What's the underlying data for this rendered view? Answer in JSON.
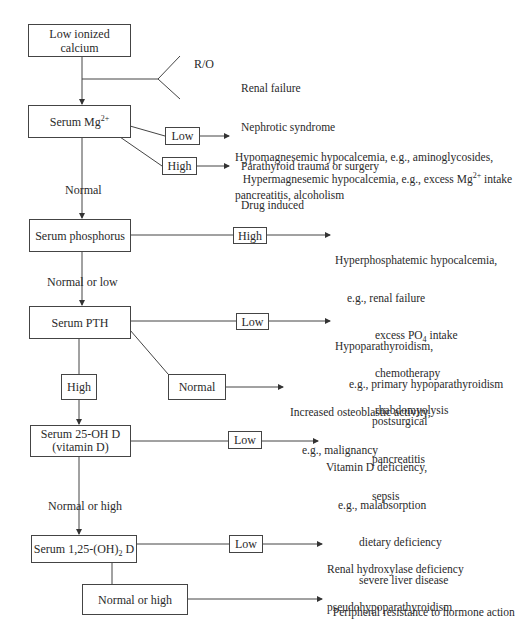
{
  "diagram": {
    "type": "flowchart",
    "start": {
      "label_line1": "Low ionized",
      "label_line2": "calcium"
    },
    "rule_out": {
      "label": "R/O",
      "items": [
        "Renal failure",
        "Nephrotic syndrome",
        "Parathyroid trauma or surgery",
        "Drug induced"
      ]
    },
    "mg": {
      "label": "Serum Mg",
      "label_sup": "2+",
      "low": {
        "label": "Low",
        "outcome_line1": "Hypomagnesemic hypocalcemia, e.g., aminoglycosides,",
        "outcome_line2": "pancreatitis, alcoholism"
      },
      "high": {
        "label": "High",
        "outcome": "Hypermagnesemic hypocalcemia, e.g., excess Mg",
        "outcome_sup": "2+",
        "outcome_tail": " intake"
      },
      "normal_label": "Normal"
    },
    "phosphorus": {
      "label": "Serum phosphorus",
      "high": {
        "label": "High",
        "outcome_line1": "Hyperphosphatemic hypocalcemia,",
        "outcome_line2": "e.g., renal failure",
        "outcome_line3a": "excess PO",
        "outcome_line3_sub": "4",
        "outcome_line3b": " intake",
        "outcome_line4": "chemotherapy",
        "outcome_line5": "rhabdomyolysis"
      },
      "normal_low_label": "Normal or low"
    },
    "pth": {
      "label": "Serum PTH",
      "low": {
        "label": "Low",
        "outcome_line1": "Hypoparathyroidism,",
        "outcome_line2": "e.g., primary hypoparathyroidism",
        "outcome_line3": "postsurgical",
        "outcome_line4": "pancreatitis",
        "outcome_line5": "sepsis"
      },
      "normal": {
        "label": "Normal",
        "outcome_line1": "Increased osteoblastic activity,",
        "outcome_line2": "e.g., malignancy"
      },
      "high_label": "High"
    },
    "vitd25": {
      "label_line1": "Serum 25-OH D",
      "label_line2": "(vitamin D)",
      "low": {
        "label": "Low",
        "outcome_line1": "Vitamin D deficiency,",
        "outcome_line2": "e.g., malabsorption",
        "outcome_line3": "dietary deficiency",
        "outcome_line4": "severe liver disease"
      },
      "normal_high_label": "Normal or high"
    },
    "vitd125": {
      "label_a": "Serum 1,25-(OH)",
      "label_sub": "2",
      "label_b": " D",
      "low": {
        "label": "Low",
        "outcome_line1": "Renal hydroxylase deficiency",
        "outcome_line2": "pseudohypoparathyroidism"
      },
      "normal_high": {
        "label": "Normal or high",
        "outcome": "Peripheral resistance to hormone action"
      }
    }
  }
}
